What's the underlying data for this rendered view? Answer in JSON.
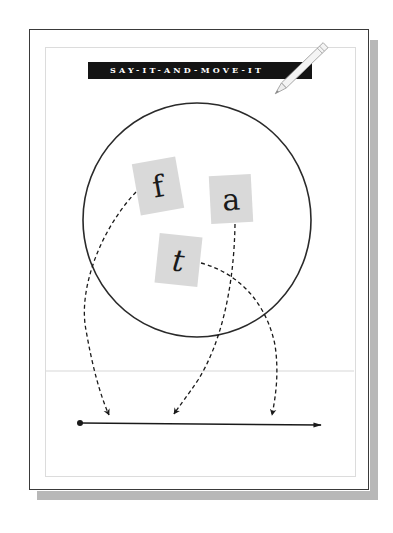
{
  "banner": {
    "title": "SAY-IT-AND-MOVE-IT"
  },
  "tiles": [
    {
      "letter": "f"
    },
    {
      "letter": "a"
    },
    {
      "letter": "t"
    }
  ],
  "icons": {
    "pencil": "pencil-icon"
  },
  "colors": {
    "banner_bg": "#141414",
    "banner_text": "#ffffff",
    "tile_bg": "#d9d9d9",
    "stroke": "#1a1a1a",
    "shadow": "#b8b8b8",
    "divider": "#dcdcdc"
  }
}
